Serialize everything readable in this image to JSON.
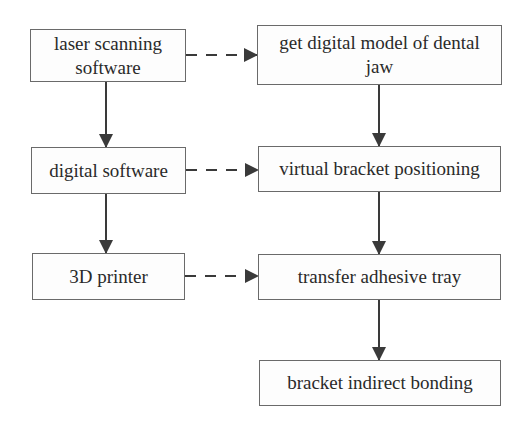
{
  "diagram": {
    "type": "flowchart",
    "left_column": [
      {
        "id": "laser",
        "label": "laser scanning software"
      },
      {
        "id": "digital",
        "label": "digital software"
      },
      {
        "id": "printer",
        "label": "3D printer"
      }
    ],
    "right_column": [
      {
        "id": "model",
        "label": "get digital model of dental jaw"
      },
      {
        "id": "virtual",
        "label": "virtual bracket positioning"
      },
      {
        "id": "tray",
        "label": "transfer adhesive tray"
      },
      {
        "id": "bonding",
        "label": "bracket indirect bonding"
      }
    ],
    "edges": [
      {
        "from": "laser",
        "to": "digital",
        "style": "solid"
      },
      {
        "from": "digital",
        "to": "printer",
        "style": "solid"
      },
      {
        "from": "laser",
        "to": "model",
        "style": "dashed"
      },
      {
        "from": "digital",
        "to": "virtual",
        "style": "dashed"
      },
      {
        "from": "printer",
        "to": "tray",
        "style": "dashed"
      },
      {
        "from": "model",
        "to": "virtual",
        "style": "solid"
      },
      {
        "from": "virtual",
        "to": "tray",
        "style": "solid"
      },
      {
        "from": "tray",
        "to": "bonding",
        "style": "solid"
      }
    ],
    "colors": {
      "stroke": "#3a3a3a",
      "border": "#6a6a6a",
      "text": "#2a2a2a",
      "background": "#ffffff"
    }
  }
}
